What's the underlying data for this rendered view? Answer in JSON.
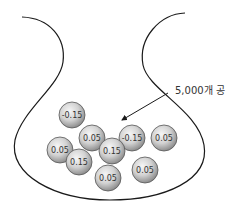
{
  "diagram": {
    "urn_label": "5,000개 공",
    "colors": {
      "outline": "#1a1a1a",
      "ball_light": "#f4f4f4",
      "ball_dark": "#9a9a9a",
      "ball_stroke": "#555555",
      "text": "#333333"
    },
    "balls": [
      {
        "label": "-0.15",
        "cx": 72,
        "cy": 115
      },
      {
        "label": "0.05",
        "cx": 92,
        "cy": 138
      },
      {
        "label": "-0.15",
        "cx": 132,
        "cy": 138
      },
      {
        "label": "0.05",
        "cx": 164,
        "cy": 138
      },
      {
        "label": "0.05",
        "cx": 60,
        "cy": 150
      },
      {
        "label": "0.15",
        "cx": 112,
        "cy": 151
      },
      {
        "label": "0.15",
        "cx": 79,
        "cy": 162
      },
      {
        "label": "0.05",
        "cx": 145,
        "cy": 170
      },
      {
        "label": "0.05",
        "cx": 108,
        "cy": 178
      }
    ]
  }
}
